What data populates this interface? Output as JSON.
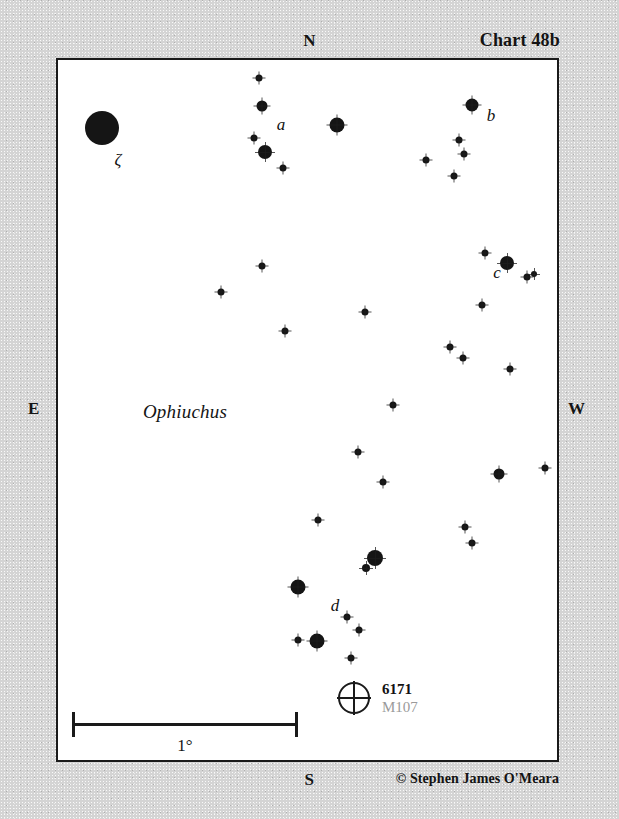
{
  "chart": {
    "title": "Chart 48b",
    "credit": "© Stephen James O'Meara",
    "constellation": "Ophiuchus",
    "compass": {
      "north": "N",
      "south": "S",
      "east": "E",
      "west": "W"
    },
    "frame": {
      "left": 56,
      "top": 58,
      "width": 503,
      "height": 704,
      "background": "#ffffff",
      "border_color": "#1a1a1a"
    },
    "background_color": "#d4d4d4"
  },
  "scale": {
    "label": "1°",
    "x1": 70,
    "x2": 296,
    "y": 721,
    "label_x": 183,
    "label_y": 734
  },
  "deep_sky_object": {
    "symbol": "globular-cluster",
    "ngc_id": "6171",
    "messier_id": "M107",
    "x": 352,
    "y": 696,
    "radius": 16,
    "id_color": "#121212",
    "alt_color": "#9a9a9a"
  },
  "star_labels": [
    {
      "text": "ζ",
      "x": 116,
      "y": 158
    },
    {
      "text": "a",
      "x": 279,
      "y": 123
    },
    {
      "text": "b",
      "x": 489,
      "y": 114
    },
    {
      "text": "c",
      "x": 495,
      "y": 271
    },
    {
      "text": "d",
      "x": 333,
      "y": 604
    }
  ],
  "chart_data": {
    "type": "scatter",
    "title": "Chart 48b",
    "xlabel": "",
    "ylabel": "",
    "note": "Star chart of the Ophiuchus field containing globular cluster NGC 6171 (M107); point radius encodes stellar magnitude (larger = brighter).",
    "stars": [
      {
        "x": 100,
        "y": 126,
        "r": 17
      },
      {
        "x": 257,
        "y": 76,
        "r": 3.5
      },
      {
        "x": 260,
        "y": 104,
        "r": 5.5
      },
      {
        "x": 252,
        "y": 136,
        "r": 3.5
      },
      {
        "x": 263,
        "y": 150,
        "r": 7
      },
      {
        "x": 281,
        "y": 166,
        "r": 3.5
      },
      {
        "x": 335,
        "y": 123,
        "r": 7.5
      },
      {
        "x": 470,
        "y": 103,
        "r": 6.5
      },
      {
        "x": 424,
        "y": 158,
        "r": 3.5
      },
      {
        "x": 457,
        "y": 138,
        "r": 3.5
      },
      {
        "x": 462,
        "y": 152,
        "r": 3.5
      },
      {
        "x": 452,
        "y": 174,
        "r": 3.5
      },
      {
        "x": 483,
        "y": 251,
        "r": 3.5
      },
      {
        "x": 505,
        "y": 261,
        "r": 7
      },
      {
        "x": 525,
        "y": 275,
        "r": 3.5
      },
      {
        "x": 532,
        "y": 272,
        "r": 3
      },
      {
        "x": 480,
        "y": 303,
        "r": 3.5
      },
      {
        "x": 260,
        "y": 264,
        "r": 3.5
      },
      {
        "x": 219,
        "y": 290,
        "r": 3.5
      },
      {
        "x": 363,
        "y": 310,
        "r": 3.5
      },
      {
        "x": 283,
        "y": 329,
        "r": 3.5
      },
      {
        "x": 448,
        "y": 345,
        "r": 3.5
      },
      {
        "x": 461,
        "y": 356,
        "r": 3.5
      },
      {
        "x": 508,
        "y": 367,
        "r": 3.5
      },
      {
        "x": 391,
        "y": 403,
        "r": 3.5
      },
      {
        "x": 356,
        "y": 450,
        "r": 3.5
      },
      {
        "x": 381,
        "y": 480,
        "r": 3.5
      },
      {
        "x": 497,
        "y": 472,
        "r": 5.5
      },
      {
        "x": 543,
        "y": 466,
        "r": 3.5
      },
      {
        "x": 463,
        "y": 525,
        "r": 3.5
      },
      {
        "x": 470,
        "y": 541,
        "r": 3.5
      },
      {
        "x": 316,
        "y": 518,
        "r": 3.5
      },
      {
        "x": 373,
        "y": 556,
        "r": 8
      },
      {
        "x": 364,
        "y": 566,
        "r": 4
      },
      {
        "x": 296,
        "y": 585,
        "r": 7.5
      },
      {
        "x": 345,
        "y": 615,
        "r": 3.5
      },
      {
        "x": 357,
        "y": 628,
        "r": 3.5
      },
      {
        "x": 296,
        "y": 638,
        "r": 3.5
      },
      {
        "x": 315,
        "y": 639,
        "r": 7.5
      },
      {
        "x": 349,
        "y": 656,
        "r": 3.5
      }
    ]
  }
}
